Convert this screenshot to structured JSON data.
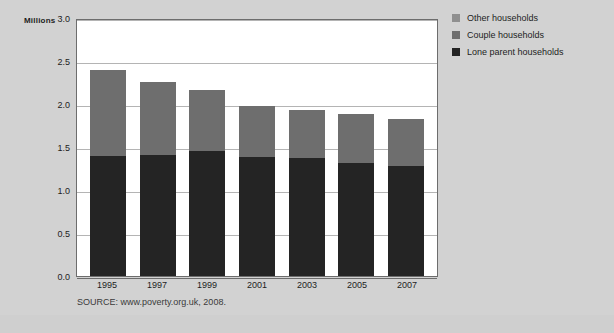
{
  "chart_data": {
    "type": "bar",
    "stacked": true,
    "title": "",
    "xlabel": "",
    "ylabel": "Millions",
    "ylim": [
      0.0,
      3.0
    ],
    "ytick_step": 0.5,
    "ytick_labels": [
      "3.0",
      "2.5",
      "2.0",
      "1.5",
      "1.0",
      "0.5",
      "0.0"
    ],
    "ytick_values": [
      3.0,
      2.5,
      2.0,
      1.5,
      1.0,
      0.5,
      0.0
    ],
    "grid": true,
    "legend_position": "top-right",
    "categories": [
      "1995",
      "1997",
      "1999",
      "2001",
      "2003",
      "2005",
      "2007"
    ],
    "series": [
      {
        "name": "Other households",
        "color": "#8f8f8f",
        "values": [
          0.0,
          0.0,
          0.0,
          0.0,
          0.0,
          0.0,
          0.0
        ]
      },
      {
        "name": "Couple households",
        "color": "#6e6e6e",
        "values": [
          1.0,
          0.85,
          0.71,
          0.6,
          0.56,
          0.57,
          0.55
        ]
      },
      {
        "name": "Lone parent households",
        "color": "#242424",
        "values": [
          1.4,
          1.41,
          1.45,
          1.38,
          1.37,
          1.31,
          1.28
        ]
      }
    ],
    "totals": [
      2.4,
      2.26,
      2.16,
      1.98,
      1.93,
      1.88,
      1.83
    ],
    "units_caption": "Millions",
    "source": "SOURCE: www.poverty.org.uk, 2008."
  },
  "legend": {
    "items": [
      {
        "label": "Other households",
        "color": "#8f8f8f"
      },
      {
        "label": "Couple households",
        "color": "#6e6e6e"
      },
      {
        "label": "Lone parent households",
        "color": "#242424"
      }
    ]
  },
  "colors": {
    "page_background": "#cfcfcf",
    "figure_background": "#d2d2d2",
    "plot_background": "#ffffff",
    "axis_line": "#6d6d6d",
    "gridline": "#b4b4b4",
    "text": "#1d1d1d"
  }
}
